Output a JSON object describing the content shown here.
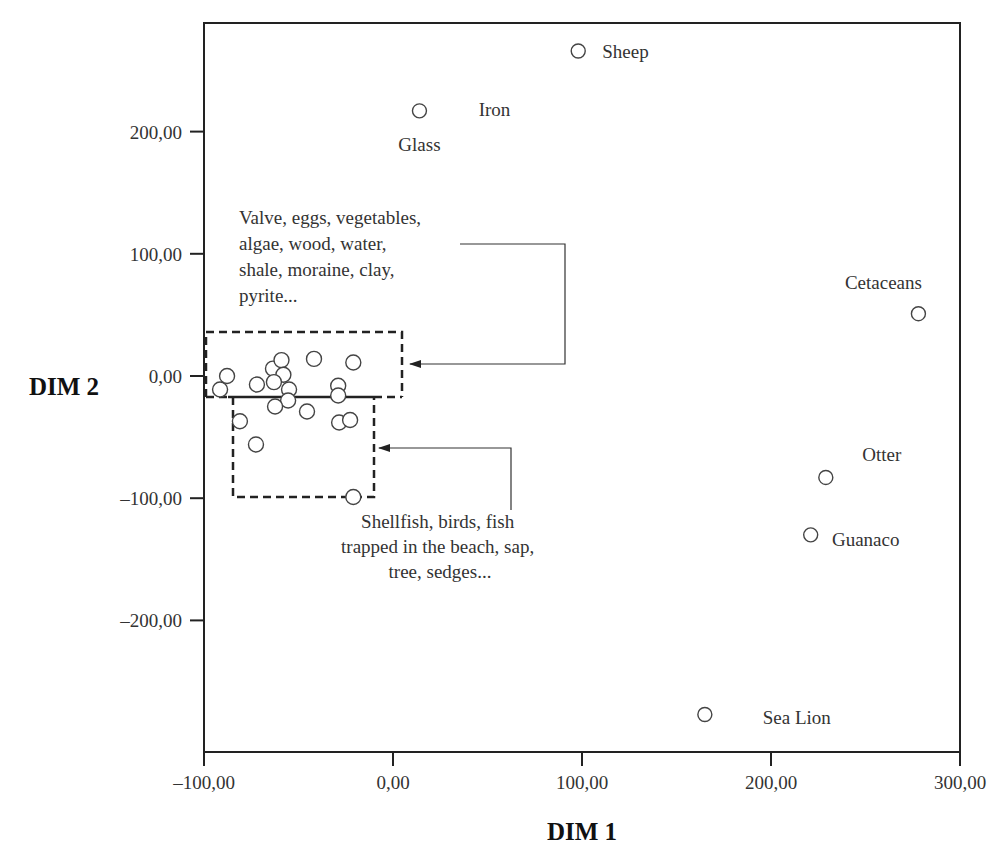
{
  "chart_data": {
    "type": "scatter",
    "title": "",
    "xlabel": "DIM 1",
    "ylabel": "DIM 2",
    "xlim": [
      -100,
      300
    ],
    "ylim": [
      -300,
      280
    ],
    "grid": false,
    "legend": null,
    "x_ticks": [
      -100,
      0,
      100,
      200,
      300
    ],
    "x_tick_labels": [
      "–100,00",
      "0,00",
      "100,00",
      "200,00",
      "300,00"
    ],
    "y_ticks": [
      200,
      100,
      0,
      -100,
      -200
    ],
    "y_tick_labels": [
      "200,00",
      "100,00",
      "0,00",
      "–100,00",
      "–200,00"
    ],
    "labeled_points": [
      {
        "name": "Sheep",
        "x": 98,
        "y": 266,
        "label_dx": 24,
        "label_dy": 7,
        "anchor": "start"
      },
      {
        "name": "Glass",
        "x": 14,
        "y": 217,
        "label_dx": 0,
        "label_dy": 40,
        "anchor": "middle"
      },
      {
        "name": "Iron",
        "x": 14,
        "y": 217,
        "label_dx": 75,
        "label_dy": 5,
        "anchor": "middle"
      },
      {
        "name": "Cetaceans",
        "x": 278,
        "y": 51,
        "label_dx": -35,
        "label_dy": -25,
        "anchor": "middle"
      },
      {
        "name": "Otter",
        "x": 229,
        "y": -83,
        "label_dx": 56,
        "label_dy": -16,
        "anchor": "middle"
      },
      {
        "name": "Guanaco",
        "x": 221,
        "y": -130,
        "label_dx": 55,
        "label_dy": 11,
        "anchor": "middle"
      },
      {
        "name": "Sea Lion",
        "x": 165,
        "y": -277,
        "label_dx": 92,
        "label_dy": 10,
        "anchor": "middle"
      }
    ],
    "cluster_points": [
      {
        "x": -91.5,
        "y": -11
      },
      {
        "x": -87.8,
        "y": 0
      },
      {
        "x": -72,
        "y": -7
      },
      {
        "x": -63.5,
        "y": 6
      },
      {
        "x": -59,
        "y": 13
      },
      {
        "x": -58,
        "y": 1
      },
      {
        "x": -63,
        "y": -5
      },
      {
        "x": -55,
        "y": -11
      },
      {
        "x": -55.5,
        "y": -20
      },
      {
        "x": -41.8,
        "y": 14
      },
      {
        "x": -21,
        "y": 11
      },
      {
        "x": -29,
        "y": -8
      },
      {
        "x": -29,
        "y": -16
      },
      {
        "x": -45.5,
        "y": -29
      },
      {
        "x": -28.5,
        "y": -38
      },
      {
        "x": -22.7,
        "y": -36
      },
      {
        "x": -62.4,
        "y": -25
      },
      {
        "x": -81,
        "y": -37
      },
      {
        "x": -72.5,
        "y": -56
      },
      {
        "x": -21,
        "y": -99
      }
    ],
    "annotations": [
      {
        "id": "upper-group",
        "lines": [
          "Valve, eggs, vegetables,",
          "algae, wood, water,",
          "shale, moraine, clay,",
          "pyrite..."
        ],
        "box_data": {
          "x0": -98.4,
          "x1": 4.8,
          "y0": -17,
          "y1": 36
        }
      },
      {
        "id": "lower-group",
        "lines": [
          "Shellfish, birds, fish",
          "trapped in the beach, sap,",
          "tree, sedges..."
        ],
        "box_data": {
          "x0": -84.7,
          "x1": -10.1,
          "y0": -99,
          "y1": -17
        }
      }
    ]
  },
  "layout": {
    "plot": {
      "left": 204,
      "top": 23,
      "right": 960,
      "bottom": 752
    },
    "x_px_per_unit": 1.89,
    "x_zero_px": 393,
    "y_px_per_unit": 1.222,
    "y_zero_px": 376
  }
}
